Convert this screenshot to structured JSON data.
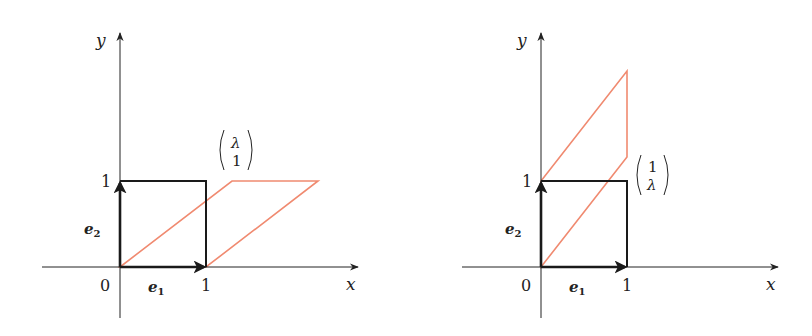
{
  "colors": {
    "axis": "#222222",
    "unit_square": "#1a1a1a",
    "transformed": "#f08a70",
    "background": "#ffffff"
  },
  "panels": [
    {
      "id": "shear-x",
      "axis_labels": {
        "x": "x",
        "y": "y"
      },
      "tick_labels": {
        "origin": "0",
        "x_one": "1",
        "y_one": "1"
      },
      "basis_vectors": {
        "e1": {
          "base": "e",
          "sub": "1"
        },
        "e2": {
          "base": "e",
          "sub": "2"
        }
      },
      "column_vector": {
        "top": "λ",
        "bottom": "1"
      },
      "geometry": {
        "origin_px": [
          120,
          267
        ],
        "unit_px": 86,
        "unit_square": [
          [
            0,
            0
          ],
          [
            1,
            0
          ],
          [
            1,
            1
          ],
          [
            0,
            1
          ]
        ],
        "transformed_shape": [
          [
            0,
            0
          ],
          [
            1.3,
            1
          ],
          [
            2.3,
            1
          ],
          [
            1,
            0
          ]
        ]
      }
    },
    {
      "id": "shear-y",
      "axis_labels": {
        "x": "x",
        "y": "y"
      },
      "tick_labels": {
        "origin": "0",
        "x_one": "1",
        "y_one": "1"
      },
      "basis_vectors": {
        "e1": {
          "base": "e",
          "sub": "1"
        },
        "e2": {
          "base": "e",
          "sub": "2"
        }
      },
      "column_vector": {
        "top": "1",
        "bottom": "λ"
      },
      "geometry": {
        "origin_px": [
          541,
          267
        ],
        "unit_px": 86,
        "unit_square": [
          [
            0,
            0
          ],
          [
            1,
            0
          ],
          [
            1,
            1
          ],
          [
            0,
            1
          ]
        ],
        "transformed_shape": [
          [
            0,
            0
          ],
          [
            0,
            1
          ],
          [
            1,
            2.3
          ],
          [
            1,
            1.3
          ]
        ]
      }
    }
  ]
}
